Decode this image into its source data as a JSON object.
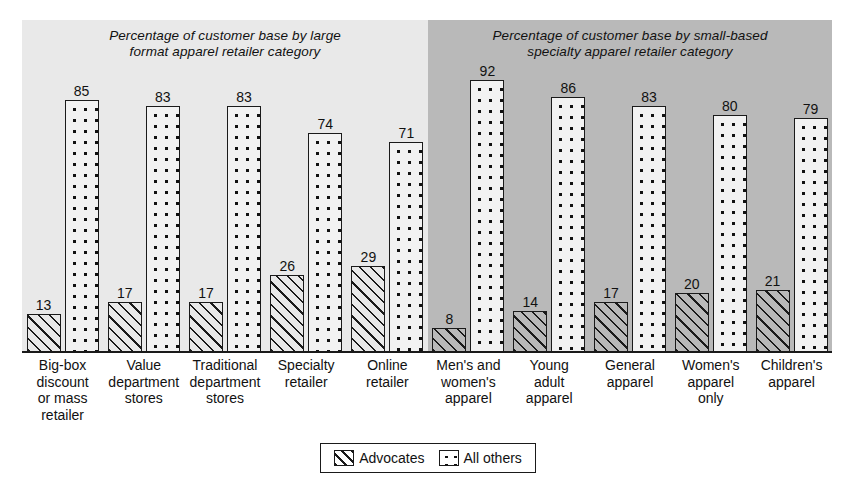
{
  "chart_data": {
    "type": "bar",
    "title": "",
    "xlabel": "",
    "ylabel": "",
    "ylim": [
      0,
      100
    ],
    "grid": false,
    "legend_position": "bottom-center",
    "panels": [
      {
        "title": "Percentage of customer base by large format apparel retailer category",
        "background": "#e9e9e9",
        "categories": [
          "Big-box discount or mass retailer",
          "Value department stores",
          "Traditional department stores",
          "Specialty retailer",
          "Online retailer"
        ],
        "series": [
          {
            "name": "Advocates",
            "values": [
              13,
              17,
              17,
              26,
              29
            ]
          },
          {
            "name": "All others",
            "values": [
              85,
              83,
              83,
              74,
              71
            ]
          }
        ]
      },
      {
        "title": "Percentage of customer base by small-based specialty apparel retailer category",
        "background": "#b9b9b9",
        "categories": [
          "Men's and women's apparel",
          "Young adult apparel",
          "General apparel",
          "Women's apparel only",
          "Children's apparel"
        ],
        "series": [
          {
            "name": "Advocates",
            "values": [
              8,
              14,
              17,
              20,
              21
            ]
          },
          {
            "name": "All others",
            "values": [
              92,
              86,
              83,
              80,
              79
            ]
          }
        ]
      }
    ],
    "legend": [
      {
        "label": "Advocates",
        "pattern": "diagonal-hatch"
      },
      {
        "label": "All others",
        "pattern": "dot-grid"
      }
    ]
  },
  "panel_left": {
    "title_line1": "Percentage of customer base by large",
    "title_line2": "format apparel retailer category",
    "cats": [
      "Big-box\ndiscount\nor mass\nretailer",
      "Value\ndepartment\nstores",
      "Traditional\ndepartment\nstores",
      "Specialty\nretailer",
      "Online\nretailer"
    ],
    "adv": [
      "13",
      "17",
      "17",
      "26",
      "29"
    ],
    "oth": [
      "85",
      "83",
      "83",
      "74",
      "71"
    ]
  },
  "panel_right": {
    "title_line1": "Percentage of customer base by small-based",
    "title_line2": "specialty apparel retailer category",
    "cats": [
      "Men's and\nwomen's\napparel",
      "Young\nadult\napparel",
      "General\napparel",
      "Women's\napparel\nonly",
      "Children's\napparel"
    ],
    "adv": [
      "8",
      "14",
      "17",
      "20",
      "21"
    ],
    "oth": [
      "92",
      "86",
      "83",
      "80",
      "79"
    ]
  },
  "legend": {
    "advocates_label": "Advocates",
    "others_label": "All others"
  },
  "colors": {
    "panel_left_bg": "#e9e9e9",
    "panel_right_bg": "#b9b9b9",
    "ink": "#1a1a1a",
    "page_bg": "#ffffff"
  }
}
